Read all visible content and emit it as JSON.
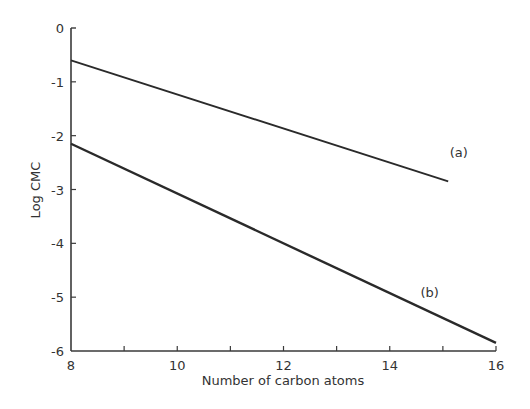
{
  "chart_data": {
    "type": "line",
    "title": "",
    "xlabel": "Number of carbon atoms",
    "ylabel": "Log CMC",
    "xlim": [
      8,
      16
    ],
    "ylim": [
      -6,
      0
    ],
    "x_ticks": [
      8,
      9,
      10,
      11,
      12,
      13,
      14,
      15,
      16
    ],
    "x_tick_labels": [
      "8",
      "10",
      "12",
      "14",
      "16"
    ],
    "y_ticks": [
      0,
      -1,
      -2,
      -3,
      -4,
      -5,
      -6
    ],
    "y_tick_labels": [
      "0",
      "-1",
      "-2",
      "-3",
      "-4",
      "-5",
      "-6"
    ],
    "grid": false,
    "legend": "inline labels",
    "series": [
      {
        "name": "(a)",
        "x": [
          8,
          15.1
        ],
        "y": [
          -0.6,
          -2.85
        ],
        "label_pos": [
          15.3,
          -2.4
        ]
      },
      {
        "name": "(b)",
        "x": [
          8,
          16
        ],
        "y": [
          -2.15,
          -5.85
        ],
        "label_pos": [
          14.75,
          -5.0
        ]
      }
    ]
  },
  "style": {
    "line_color": "#2a2a2a",
    "axis_color": "#3a3a3a",
    "text_color": "#333333"
  }
}
